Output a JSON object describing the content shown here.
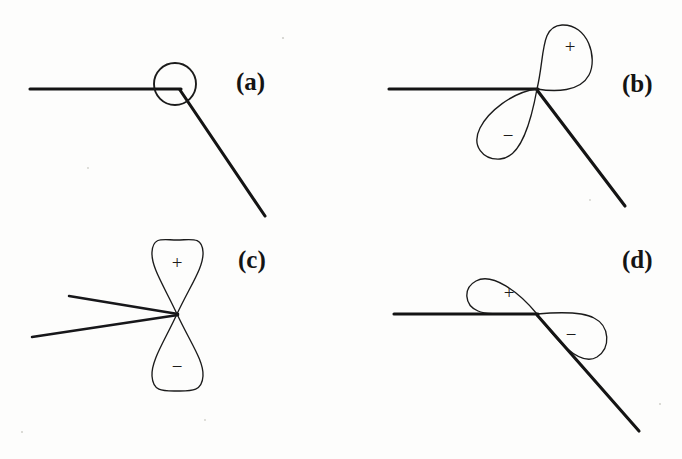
{
  "figure": {
    "background_color": "#fdfdfc",
    "ink_color": "#1b1b1b",
    "width": 682,
    "height": 459,
    "panel_count": 4
  },
  "panels": [
    {
      "id": "panel-a",
      "label": "(a)",
      "label_x": 236,
      "label_y": 90,
      "orbital_type": "s-orbital",
      "orbital_description": "circle centered on the bond vertex",
      "lobes": [],
      "sign_labels": [],
      "vertex": {
        "x": 180,
        "y": 89
      },
      "circle": {
        "cx": 175,
        "cy": 84,
        "r": 21
      },
      "lines": [
        {
          "name": "horizontal-bond",
          "x1": 30,
          "y1": 89,
          "x2": 181,
          "y2": 89
        },
        {
          "name": "diagonal-bond",
          "x1": 180,
          "y1": 90,
          "x2": 265,
          "y2": 216
        }
      ]
    },
    {
      "id": "panel-b",
      "label": "(b)",
      "label_x": 622,
      "label_y": 92,
      "orbital_type": "p-orbital",
      "orbital_description": "two lobes tilted, plus lobe up-right, minus lobe down-left",
      "lobes": [
        {
          "sign": "+",
          "direction": "up-right",
          "tip_x": 562,
          "tip_y": 26
        },
        {
          "sign": "−",
          "direction": "down-left",
          "tip_x": 484,
          "tip_y": 156
        }
      ],
      "sign_labels": [
        {
          "text": "+",
          "x": 570,
          "y": 46
        },
        {
          "text": "−",
          "x": 508,
          "y": 135
        }
      ],
      "vertex": {
        "x": 537,
        "y": 89
      },
      "lines": [
        {
          "name": "horizontal-bond",
          "x1": 389,
          "y1": 89,
          "x2": 538,
          "y2": 89
        },
        {
          "name": "diagonal-bond",
          "x1": 537,
          "y1": 90,
          "x2": 625,
          "y2": 206
        }
      ]
    },
    {
      "id": "panel-c",
      "label": "(c)",
      "label_x": 238,
      "label_y": 268,
      "orbital_type": "p-orbital",
      "orbital_description": "vertical two-lobe orbital, plus lobe on top, minus lobe below",
      "lobes": [
        {
          "sign": "+",
          "direction": "up",
          "tip_x": 177,
          "tip_y": 240
        },
        {
          "sign": "−",
          "direction": "down",
          "tip_x": 177,
          "tip_y": 391
        }
      ],
      "sign_labels": [
        {
          "text": "+",
          "x": 177,
          "y": 262
        },
        {
          "text": "−",
          "x": 177,
          "y": 366
        }
      ],
      "vertex": {
        "x": 177,
        "y": 314
      },
      "lines": [
        {
          "name": "upper-bond",
          "x1": 69,
          "y1": 296,
          "x2": 178,
          "y2": 314
        },
        {
          "name": "lower-bond",
          "x1": 32,
          "y1": 337,
          "x2": 178,
          "y2": 315
        }
      ]
    },
    {
      "id": "panel-d",
      "label": "(d)",
      "label_x": 622,
      "label_y": 268,
      "orbital_type": "p-orbital",
      "orbital_description": "nearly horizontal two-lobe orbital, plus lobe left above the bond, minus lobe right below the bond",
      "lobes": [
        {
          "sign": "+",
          "direction": "left-up",
          "tip_x": 471,
          "tip_y": 286
        },
        {
          "sign": "−",
          "direction": "right-down",
          "tip_x": 601,
          "tip_y": 331
        }
      ],
      "sign_labels": [
        {
          "text": "+",
          "x": 509,
          "y": 292
        },
        {
          "text": "−",
          "x": 571,
          "y": 334
        }
      ],
      "vertex": {
        "x": 537,
        "y": 314
      },
      "lines": [
        {
          "name": "horizontal-bond",
          "x1": 394,
          "y1": 314,
          "x2": 538,
          "y2": 314
        },
        {
          "name": "diagonal-bond",
          "x1": 537,
          "y1": 315,
          "x2": 639,
          "y2": 431
        }
      ]
    }
  ]
}
